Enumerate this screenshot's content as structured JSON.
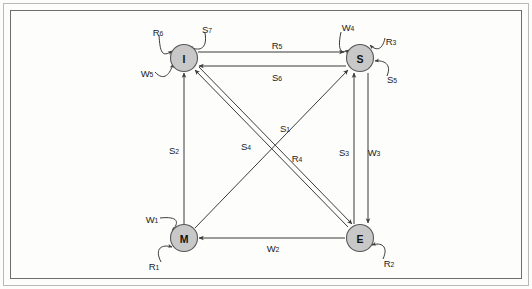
{
  "diagram": {
    "colors": {
      "node_fill": "#c8c8c8",
      "node_stroke": "#58585a",
      "edge": "#3b3b3b",
      "frame": "#6d6d6d",
      "background": "#fdfdfc"
    },
    "nodes": [
      {
        "id": "I",
        "label": "I",
        "x": 184,
        "y": 58
      },
      {
        "id": "S",
        "label": "S",
        "x": 360,
        "y": 58
      },
      {
        "id": "M",
        "label": "M",
        "x": 184,
        "y": 238
      },
      {
        "id": "E",
        "label": "E",
        "x": 360,
        "y": 238
      }
    ],
    "edges": [
      {
        "id": "R5",
        "base": "R",
        "sub": "5",
        "label": "R5",
        "from": "I",
        "to": "S",
        "label_x": 277,
        "label_y": 45
      },
      {
        "id": "S6",
        "base": "S",
        "sub": "6",
        "label": "S6",
        "from": "S",
        "to": "I",
        "label_x": 277,
        "label_y": 77
      },
      {
        "id": "S2",
        "base": "S",
        "sub": "2",
        "label": "S2",
        "from": "M",
        "to": "I",
        "label_x": 174,
        "label_y": 150
      },
      {
        "id": "S3",
        "base": "S",
        "sub": "3",
        "label": "S3",
        "from": "E",
        "to": "S",
        "label_x": 344,
        "label_y": 152
      },
      {
        "id": "W3",
        "base": "W",
        "sub": "3",
        "label": "W3",
        "from": "S",
        "to": "E",
        "label_x": 374,
        "label_y": 152
      },
      {
        "id": "W2",
        "base": "W",
        "sub": "2",
        "label": "W2",
        "from": "E",
        "to": "M",
        "label_x": 273,
        "label_y": 248
      },
      {
        "id": "S1",
        "base": "S",
        "sub": "1",
        "label": "S1",
        "from": "M",
        "to": "S",
        "label_x": 285,
        "label_y": 128
      },
      {
        "id": "S4",
        "base": "S",
        "sub": "4",
        "label": "S4",
        "from": "E",
        "to": "I",
        "label_x": 246,
        "label_y": 146
      },
      {
        "id": "R4",
        "base": "R",
        "sub": "4",
        "label": "R4",
        "from": "I",
        "to": "E",
        "label_x": 297,
        "label_y": 158
      }
    ],
    "self_loops": [
      {
        "id": "R6",
        "base": "R",
        "sub": "6",
        "label": "R6",
        "node": "I",
        "label_x": 158,
        "label_y": 32
      },
      {
        "id": "S7",
        "base": "S",
        "sub": "7",
        "label": "S7",
        "node": "I",
        "label_x": 207,
        "label_y": 29
      },
      {
        "id": "W5",
        "base": "W",
        "sub": "5",
        "label": "W5",
        "node": "I",
        "label_x": 147,
        "label_y": 73
      },
      {
        "id": "W4",
        "base": "W",
        "sub": "4",
        "label": "W4",
        "node": "S",
        "label_x": 348,
        "label_y": 27
      },
      {
        "id": "R3",
        "base": "R",
        "sub": "3",
        "label": "R3",
        "node": "S",
        "label_x": 391,
        "label_y": 41
      },
      {
        "id": "S5",
        "base": "S",
        "sub": "5",
        "label": "S5",
        "node": "S",
        "label_x": 392,
        "label_y": 79
      },
      {
        "id": "W1",
        "base": "W",
        "sub": "1",
        "label": "W1",
        "node": "M",
        "label_x": 152,
        "label_y": 219
      },
      {
        "id": "R1",
        "base": "R",
        "sub": "1",
        "label": "R1",
        "node": "M",
        "label_x": 154,
        "label_y": 266
      },
      {
        "id": "R2",
        "base": "R",
        "sub": "2",
        "label": "R2",
        "node": "E",
        "label_x": 389,
        "label_y": 263
      }
    ]
  }
}
